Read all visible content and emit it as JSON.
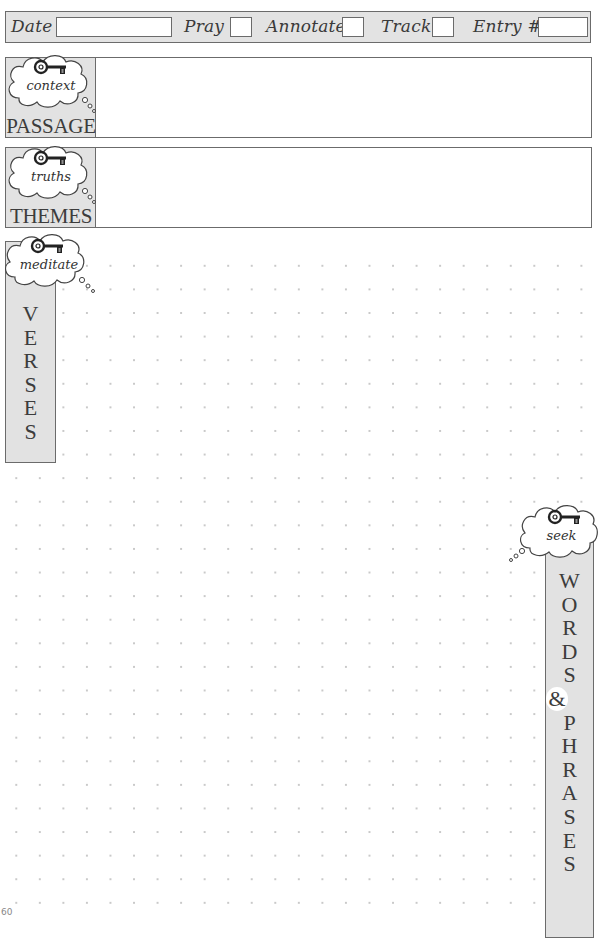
{
  "header": {
    "date_label": "Date",
    "date_value": "",
    "pray_label": "Pray",
    "pray_checked": false,
    "annotate_label": "Annotate",
    "annotate_checked": false,
    "track_label": "Track",
    "track_checked": false,
    "entry_label": "Entry #",
    "entry_value": ""
  },
  "sections": {
    "passage": {
      "cloud_word": "context",
      "label": "PASSAGE",
      "content": ""
    },
    "themes": {
      "cloud_word": "truths",
      "label": "THEMES",
      "content": ""
    },
    "verses": {
      "cloud_word": "meditate",
      "letters": [
        "V",
        "E",
        "R",
        "S",
        "E",
        "S"
      ]
    },
    "words": {
      "cloud_word": "seek",
      "letters": [
        "W",
        "O",
        "R",
        "D",
        "S",
        "&",
        "P",
        "H",
        "R",
        "A",
        "S",
        "E",
        "S"
      ]
    }
  },
  "icons": {
    "key": "key-icon",
    "thought_cloud": "thought-cloud-icon"
  },
  "colors": {
    "panel_fill": "#e2e2e2",
    "border": "#6b6b6b",
    "dot": "#c9c9c9",
    "text": "#3c3c3c"
  },
  "footer": {
    "page_number": "60"
  }
}
